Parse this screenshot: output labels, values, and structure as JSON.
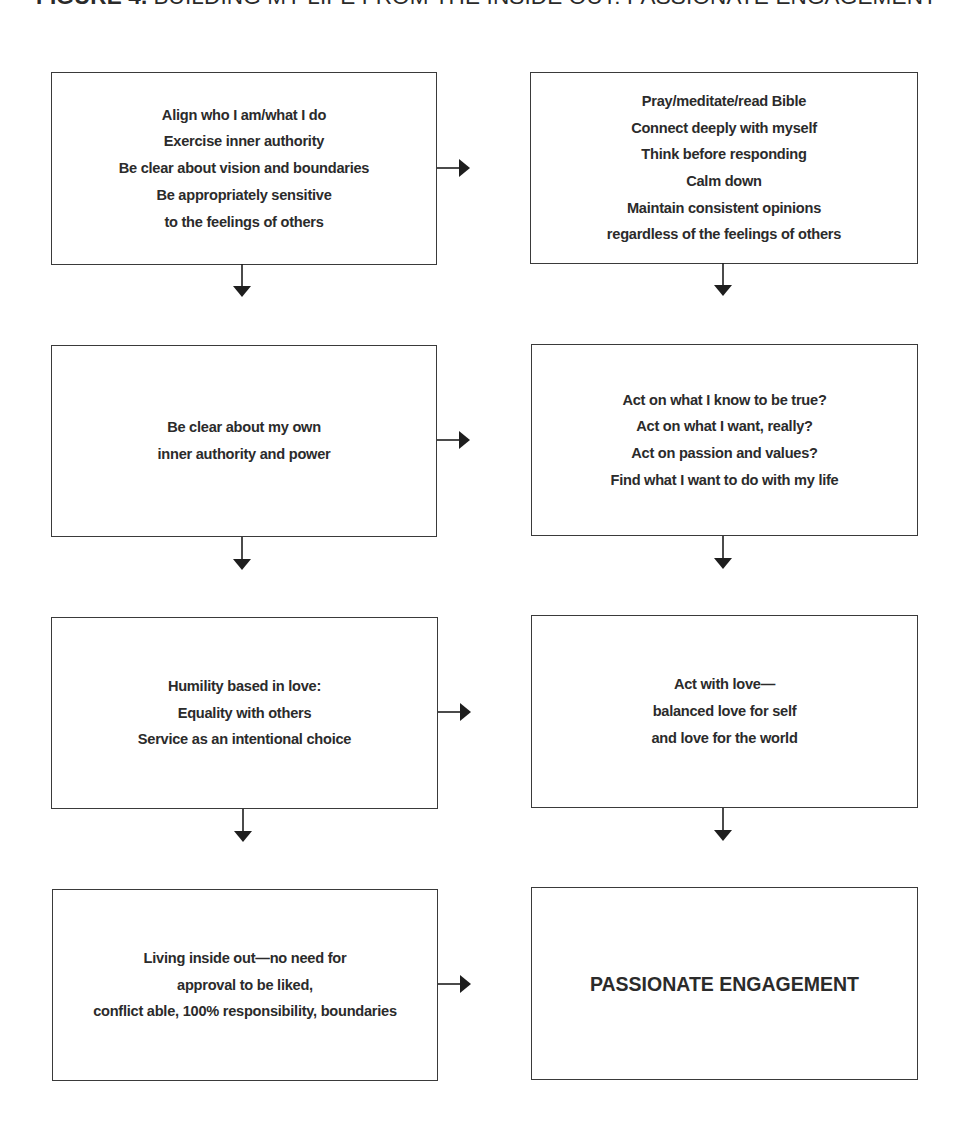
{
  "figure": {
    "label": "FIGURE 4.",
    "caption": "BUILDING MY LIFE FROM THE INSIDE OUT: PASSIONATE ENGAGEMENT"
  },
  "diagram": {
    "left_column": [
      {
        "id": "align",
        "lines": [
          "Align who I am/what I do",
          "Exercise inner authority",
          "Be clear about vision and boundaries",
          "Be appropriately sensitive",
          "to the feelings of others"
        ]
      },
      {
        "id": "inner-authority",
        "lines": [
          "Be clear about my own",
          "inner authority and power"
        ]
      },
      {
        "id": "humility",
        "lines": [
          "Humility based in love:",
          "Equality with others",
          "Service as an intentional choice"
        ]
      },
      {
        "id": "living-inside-out",
        "lines": [
          "Living inside out—no need for",
          "approval to be liked,",
          "conflict able, 100% responsibility, boundaries"
        ]
      }
    ],
    "right_column": [
      {
        "id": "pray",
        "lines": [
          "Pray/meditate/read Bible",
          "Connect deeply with myself",
          "Think before responding",
          "Calm down",
          "Maintain consistent opinions",
          "regardless of the feelings of others"
        ]
      },
      {
        "id": "act-on-truth",
        "lines": [
          "Act on what I know to be true?",
          "Act on what I want, really?",
          "Act on passion and values?",
          "Find what I want to do with my life"
        ]
      },
      {
        "id": "act-with-love",
        "lines": [
          "Act with love—",
          "balanced love for self",
          "and love for the world"
        ]
      },
      {
        "id": "passionate-engagement",
        "lines": [
          "PASSIONATE ENGAGEMENT"
        ]
      }
    ],
    "connectors": [
      {
        "from": "align",
        "to": "pray",
        "direction": "right"
      },
      {
        "from": "align",
        "to": "inner-authority",
        "direction": "down"
      },
      {
        "from": "pray",
        "to": "act-on-truth",
        "direction": "down"
      },
      {
        "from": "inner-authority",
        "to": "act-on-truth",
        "direction": "right"
      },
      {
        "from": "inner-authority",
        "to": "humility",
        "direction": "down"
      },
      {
        "from": "act-on-truth",
        "to": "act-with-love",
        "direction": "down"
      },
      {
        "from": "humility",
        "to": "act-with-love",
        "direction": "right"
      },
      {
        "from": "humility",
        "to": "living-inside-out",
        "direction": "down"
      },
      {
        "from": "act-with-love",
        "to": "passionate-engagement",
        "direction": "down"
      },
      {
        "from": "living-inside-out",
        "to": "passionate-engagement",
        "direction": "right"
      }
    ]
  },
  "colors": {
    "text": "#2b2b2b",
    "border": "#3a3a3a",
    "arrow": "#1e1e1e",
    "background": "#ffffff"
  }
}
